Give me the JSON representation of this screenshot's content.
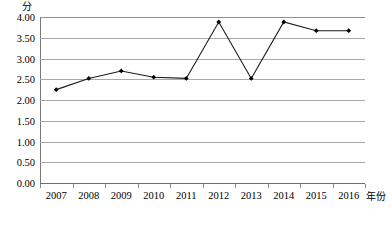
{
  "chart_data": {
    "type": "line",
    "title": "",
    "subtitle": "",
    "xlabel": "年份",
    "ylabel": "分",
    "y_unit_label": "分",
    "x_axis_title": "年份",
    "categories": [
      "2007",
      "2008",
      "2009",
      "2010",
      "2011",
      "2012",
      "2013",
      "2014",
      "2015",
      "2016"
    ],
    "series": [
      {
        "name": "",
        "values": [
          2.25,
          2.52,
          2.7,
          2.55,
          2.52,
          3.88,
          2.52,
          3.88,
          3.67,
          3.67
        ]
      }
    ],
    "ylim": [
      0.0,
      4.0
    ],
    "ytick_values": [
      4.0,
      3.5,
      3.0,
      2.5,
      2.0,
      1.5,
      1.0,
      0.5,
      0.0
    ],
    "ytick_labels": [
      "4.00",
      "3.50",
      "3.00",
      "2.50",
      "2.00",
      "1.50",
      "1.00",
      "0.50",
      "0.00"
    ],
    "grid": true,
    "grid_axis": "y",
    "legend": false,
    "legend_position": "none",
    "marker": "diamond",
    "line_color": "#1a1a1a",
    "marker_color": "#000000",
    "gridline_color": "#a9a9a9",
    "axis_color": "#7a7a7a",
    "background_color": "#ffffff"
  }
}
